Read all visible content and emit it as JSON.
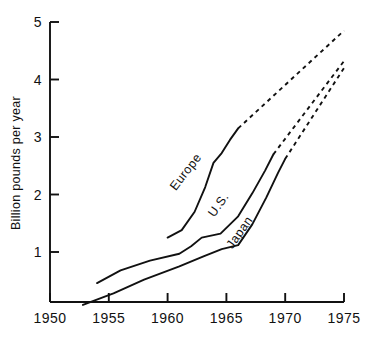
{
  "chart_data": {
    "type": "line",
    "title": "",
    "xlabel": "",
    "ylabel": "Billion pounds per year",
    "xlim": [
      1950,
      1975
    ],
    "ylim": [
      0,
      5
    ],
    "grid": false,
    "legend": "inline-labels",
    "xticks": [
      1950,
      1955,
      1960,
      1965,
      1970,
      1975
    ],
    "yticks": [
      1,
      2,
      3,
      4,
      5
    ],
    "xtick_labels": [
      "1950",
      "1955",
      "1960",
      "1965",
      "1970",
      "1975"
    ],
    "ytick_labels": [
      "1",
      "2",
      "3",
      "4",
      "5"
    ],
    "series": [
      {
        "name": "Europe",
        "style": "solid-then-dashed",
        "solid": [
          [
            1960.0,
            1.25
          ],
          [
            1961.2,
            1.38
          ],
          [
            1962.3,
            1.7
          ],
          [
            1963.2,
            2.13
          ],
          [
            1963.9,
            2.55
          ],
          [
            1964.6,
            2.72
          ],
          [
            1965.3,
            2.95
          ],
          [
            1966.0,
            3.15
          ]
        ],
        "dashed": [
          [
            1966.0,
            3.15
          ],
          [
            1975.0,
            4.85
          ]
        ]
      },
      {
        "name": "U.S.",
        "style": "solid-then-dashed",
        "solid": [
          [
            1954.0,
            0.46
          ],
          [
            1956.0,
            0.68
          ],
          [
            1958.5,
            0.85
          ],
          [
            1961.0,
            0.97
          ],
          [
            1962.0,
            1.1
          ],
          [
            1962.9,
            1.25
          ],
          [
            1964.5,
            1.32
          ],
          [
            1966.0,
            1.62
          ],
          [
            1967.2,
            2.02
          ],
          [
            1968.3,
            2.42
          ],
          [
            1969.0,
            2.7
          ]
        ],
        "dashed": [
          [
            1969.0,
            2.7
          ],
          [
            1975.0,
            4.32
          ]
        ]
      },
      {
        "name": "Japan",
        "style": "solid-then-dashed",
        "solid": [
          [
            1952.8,
            0.08
          ],
          [
            1954.6,
            0.22
          ],
          [
            1955.4,
            0.28
          ],
          [
            1958.0,
            0.52
          ],
          [
            1961.0,
            0.75
          ],
          [
            1963.0,
            0.92
          ],
          [
            1964.6,
            1.05
          ],
          [
            1966.0,
            1.12
          ],
          [
            1967.2,
            1.48
          ],
          [
            1968.4,
            1.95
          ],
          [
            1969.4,
            2.38
          ],
          [
            1970.0,
            2.62
          ]
        ],
        "dashed": [
          [
            1970.0,
            2.62
          ],
          [
            1975.0,
            4.2
          ]
        ]
      }
    ],
    "annotations": [
      {
        "text": "Europe",
        "x": 1961.8,
        "y": 2.35,
        "rotation": -52
      },
      {
        "text": "U.S.",
        "x": 1964.6,
        "y": 1.78,
        "rotation": -55
      },
      {
        "text": "Japan",
        "x": 1966.4,
        "y": 1.3,
        "rotation": -55
      }
    ]
  }
}
